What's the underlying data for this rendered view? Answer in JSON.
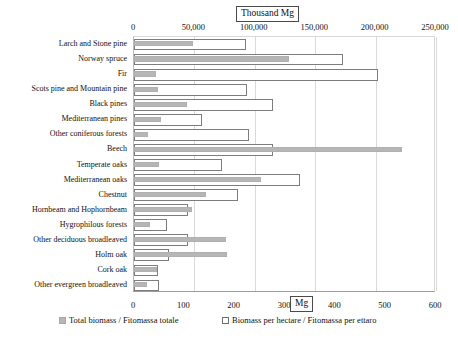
{
  "chart_data": {
    "type": "bar",
    "orientation": "horizontal",
    "title": "",
    "grid": true,
    "legend_position": "bottom",
    "top_axis": {
      "label": "Thousand Mg",
      "ticks": [
        "0",
        "50,000",
        "100,000",
        "150,000",
        "200,000",
        "250,000"
      ],
      "tick_values": [
        0,
        50000,
        100000,
        150000,
        200000,
        250000
      ],
      "lim": [
        0,
        250000
      ]
    },
    "bottom_axis": {
      "label": "Mg",
      "ticks": [
        "0",
        "100",
        "200",
        "300",
        "400",
        "500",
        "600"
      ],
      "tick_values": [
        0,
        100,
        200,
        300,
        400,
        500,
        600
      ],
      "lim": [
        0,
        600
      ]
    },
    "categories": [
      "Larch and Stone pine",
      "Norway spruce",
      "Fir",
      "Scots pine and Mountain pine",
      "Black pines",
      "Mediterranean pines",
      "Other coniferous forests",
      "Beech",
      "Temperate oaks",
      "Mediterranean oaks",
      "Chestnut",
      "Hornbeam and Hophornbeam",
      "Hygrophilous forests",
      "Other deciduous broadleaved",
      "Holm oak",
      "Cork oak",
      "Other evergreen broadleaved"
    ],
    "series": [
      {
        "name": "Total biomass / Fitomassa totale",
        "axis": "top",
        "unit": "Thousand Mg",
        "color": "#b6b6b6",
        "values": [
          49000,
          128000,
          18000,
          20000,
          44000,
          22000,
          12000,
          222000,
          21000,
          105000,
          60000,
          48000,
          13000,
          76000,
          77000,
          19000,
          11000
        ]
      },
      {
        "name": "Biomass per hectare / Fitomassa per ettaro",
        "axis": "bottom",
        "unit": "Mg",
        "color": "#ffffff",
        "values": [
          223,
          415,
          485,
          225,
          277,
          135,
          229,
          277,
          175,
          330,
          207,
          108,
          66,
          107,
          70,
          48,
          50
        ]
      }
    ]
  },
  "legend": {
    "total_label": "Total biomass / Fitomassa totale",
    "hectare_label": "Biomass per hectare / Fitomassa per ettaro"
  }
}
